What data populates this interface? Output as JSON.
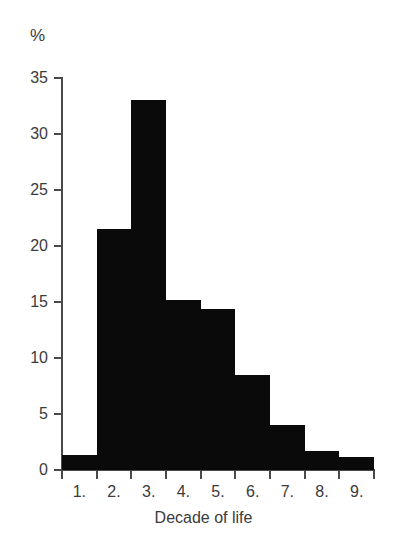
{
  "chart_data": {
    "type": "bar",
    "title": "",
    "subtitle": "",
    "xlabel": "Decade of life",
    "ylabel": "%",
    "categories": [
      "1.",
      "2.",
      "3.",
      "4.",
      "5.",
      "6.",
      "7.",
      "8.",
      "9."
    ],
    "values": [
      1.3,
      21.5,
      33.0,
      15.2,
      14.4,
      8.5,
      4.0,
      1.7,
      1.2
    ],
    "xlim": [
      0,
      9
    ],
    "ylim": [
      0,
      35
    ],
    "yticks": [
      0,
      5,
      10,
      15,
      20,
      25,
      30,
      35
    ],
    "ytick_labels": [
      "0",
      "5",
      "10",
      "15",
      "20",
      "25",
      "30",
      "35"
    ],
    "grid": false,
    "legend": false,
    "legend_position": "none",
    "bar_color": "#0a0a0a",
    "axis_color": "#4a4a4a",
    "text_color": "#3b3b3b",
    "annotations": []
  },
  "figure": {
    "unit_label": "%",
    "axis_title_x": "Decade of life"
  }
}
